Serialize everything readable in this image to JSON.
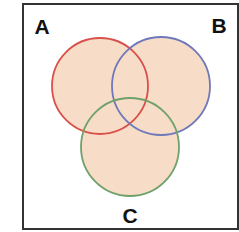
{
  "diagram": {
    "type": "venn",
    "frame": {
      "x": 23,
      "y": 4,
      "width": 215,
      "height": 225,
      "stroke": "#333333",
      "stroke_width": 2
    },
    "fill_color": "#f7dcc8",
    "fill_opacity": 0.75,
    "sets": [
      {
        "name": "A",
        "cx": 100,
        "cy": 86,
        "r": 48,
        "stroke": "#d9504a",
        "label_x": 42,
        "label_y": 34
      },
      {
        "name": "B",
        "cx": 161,
        "cy": 86,
        "r": 49,
        "stroke": "#6f78b8",
        "label_x": 219,
        "label_y": 33
      },
      {
        "name": "C",
        "cx": 130,
        "cy": 147,
        "r": 49,
        "stroke": "#6fa26a",
        "label_x": 130,
        "label_y": 223
      }
    ]
  }
}
